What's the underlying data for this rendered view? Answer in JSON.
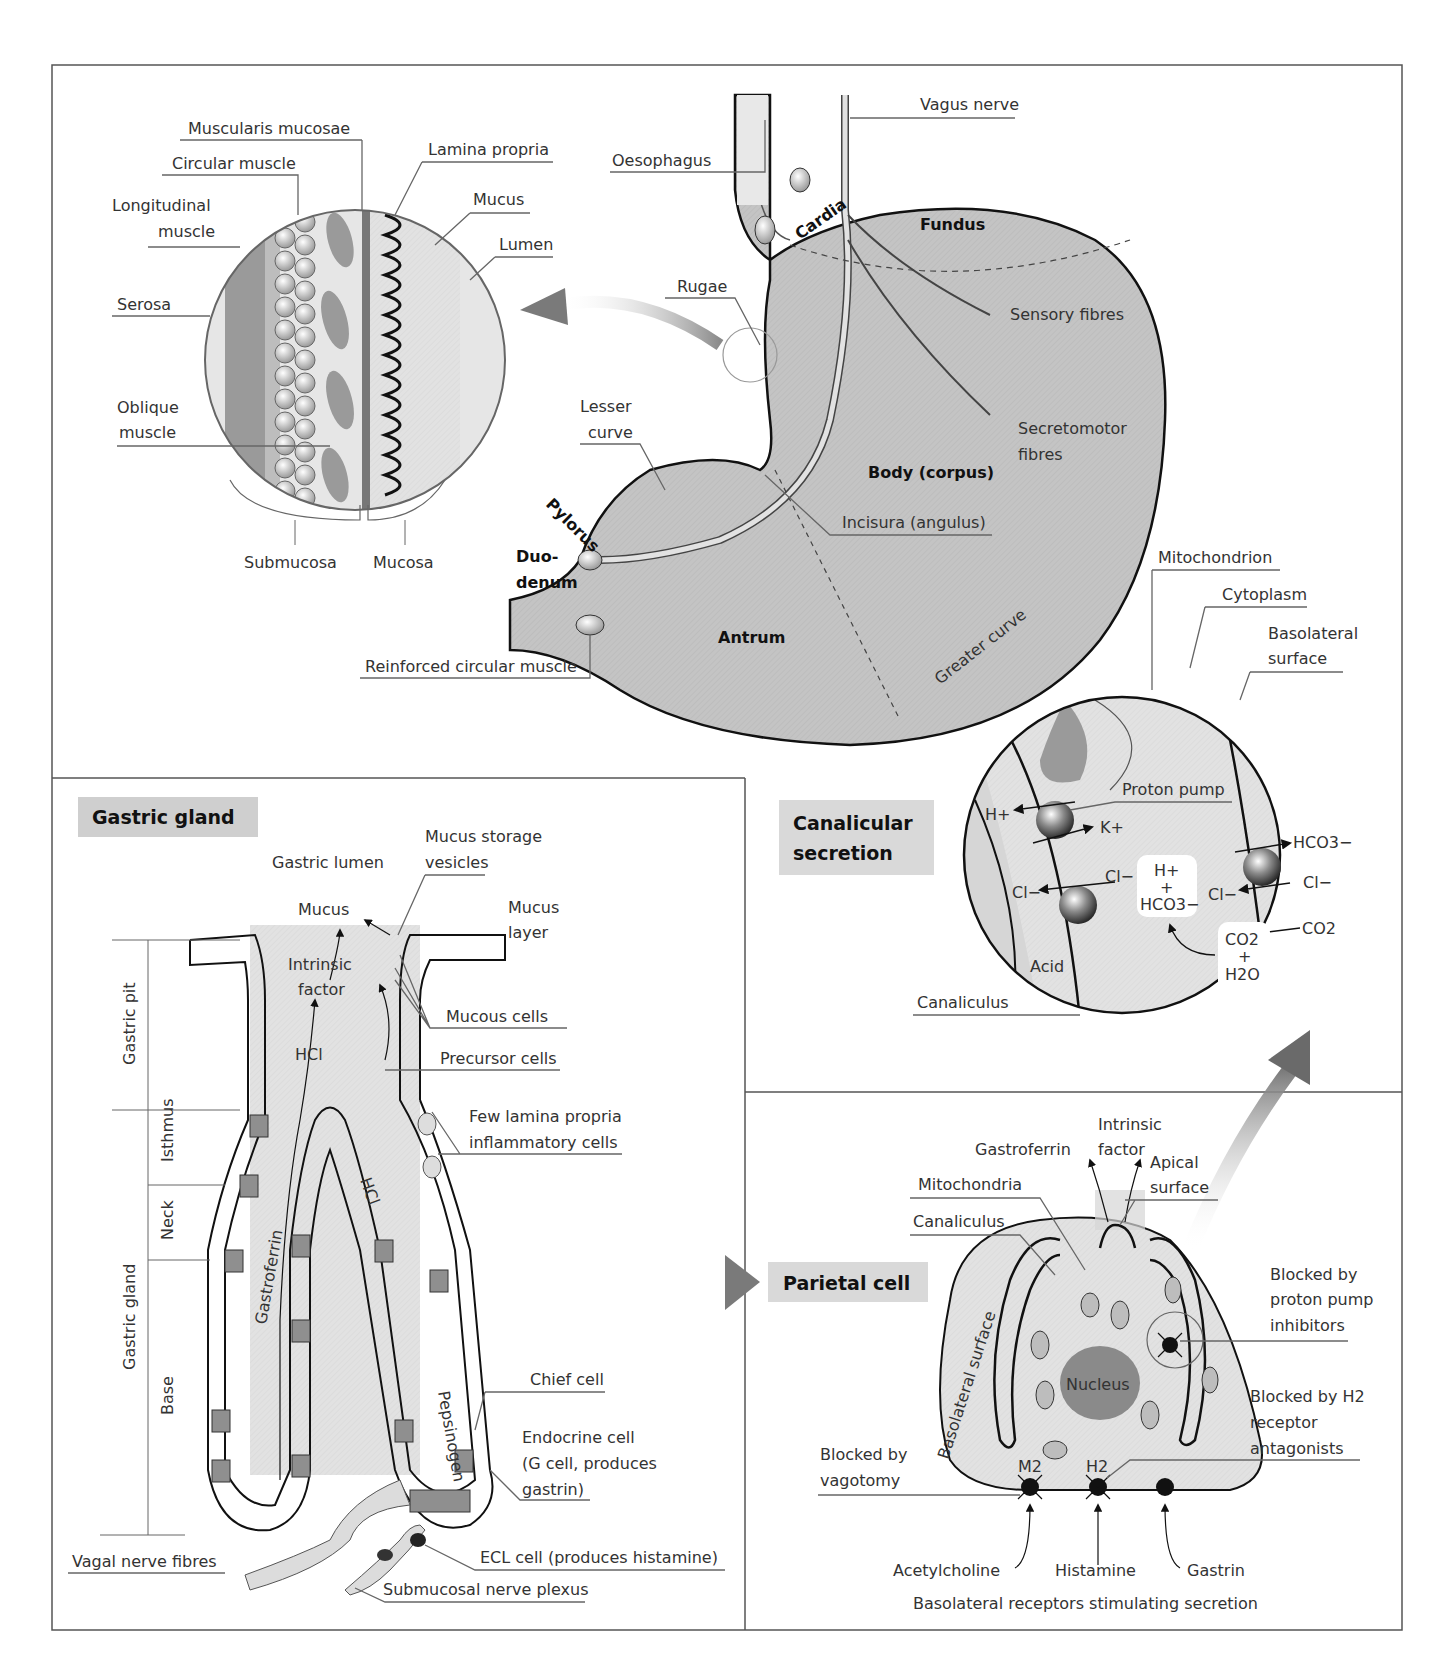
{
  "figure": {
    "panels": {
      "stomach": {
        "labels": {
          "vagus_nerve": "Vagus nerve",
          "oesophagus": "Oesophagus",
          "cardia": "Cardia",
          "fundus": "Fundus",
          "rugae": "Rugae",
          "sensory_fibres": "Sensory fibres",
          "secretomotor_1": "Secretomotor",
          "secretomotor_2": "fibres",
          "lesser_curve_1": "Lesser",
          "lesser_curve_2": "curve",
          "body": "Body (corpus)",
          "pylorus": "Pylorus",
          "incisura": "Incisura (angulus)",
          "duodenum_1": "Duo-",
          "duodenum_2": "denum",
          "antrum": "Antrum",
          "greater_curve": "Greater curve",
          "reinforced_muscle": "Reinforced circular muscle"
        }
      },
      "wall_section": {
        "labels": {
          "muscularis_mucosae": "Muscularis mucosae",
          "circular_muscle": "Circular muscle",
          "lamina_propria": "Lamina propria",
          "longitudinal_1": "Longitudinal",
          "longitudinal_2": "muscle",
          "mucus": "Mucus",
          "lumen": "Lumen",
          "serosa": "Serosa",
          "oblique_1": "Oblique",
          "oblique_2": "muscle",
          "submucosa": "Submucosa",
          "mucosa": "Mucosa"
        }
      },
      "gastric_gland": {
        "title": "Gastric gland",
        "labels": {
          "gastric_lumen": "Gastric lumen",
          "mucus_storage_1": "Mucus storage",
          "mucus_storage_2": "vesicles",
          "mucus": "Mucus",
          "mucus_layer_1": "Mucus",
          "mucus_layer_2": "layer",
          "intrinsic_1": "Intrinsic",
          "intrinsic_2": "factor",
          "mucous_cells": "Mucous cells",
          "hcl_1": "HCl",
          "hcl_2": "HCl",
          "precursor_cells": "Precursor cells",
          "inflammatory_1": "Few lamina propria",
          "inflammatory_2": "inflammatory cells",
          "gastroferrin": "Gastroferrin",
          "pepsinogen": "Pepsinogen",
          "chief_cell": "Chief cell",
          "endocrine_1": "Endocrine cell",
          "endocrine_2": "(G cell, produces",
          "endocrine_3": "gastrin)",
          "ecl_cell": "ECL cell (produces histamine)",
          "vagal_fibres": "Vagal nerve fibres",
          "submucosal_plexus": "Submucosal nerve plexus"
        },
        "zones": {
          "gastric_pit": "Gastric pit",
          "gastric_gland": "Gastric gland",
          "isthmus": "Isthmus",
          "neck": "Neck",
          "base": "Base"
        }
      },
      "canalicular": {
        "title_1": "Canalicular",
        "title_2": "secretion",
        "labels": {
          "mitochondrion": "Mitochondrion",
          "cytoplasm": "Cytoplasm",
          "basolateral_1": "Basolateral",
          "basolateral_2": "surface",
          "proton_pump": "Proton pump",
          "h_plus": "H+",
          "k_plus": "K+",
          "cl_out": "Cl−",
          "cl_in": "Cl−",
          "cl_mid": "Cl−",
          "cl_right": "Cl−",
          "hco3_out": "HCO3−",
          "box_h": "H+",
          "box_plus": "+",
          "box_hco3": "HCO3−",
          "co2_in": "CO2",
          "box2_co2": "CO2",
          "box2_plus": "+",
          "box2_h2o": "H2O",
          "acid": "Acid",
          "canaliculus": "Canaliculus"
        }
      },
      "parietal_cell": {
        "title": "Parietal cell",
        "labels": {
          "intrinsic_1": "Intrinsic",
          "intrinsic_2": "factor",
          "gastroferrin": "Gastroferrin",
          "apical_1": "Apical",
          "apical_2": "surface",
          "mitochondria": "Mitochondria",
          "canaliculus": "Canaliculus",
          "basolateral_surface": "Basolateral surface",
          "nucleus": "Nucleus",
          "ppi_1": "Blocked by",
          "ppi_2": "proton pump",
          "ppi_3": "inhibitors",
          "h2_1": "Blocked by H2",
          "h2_2": "receptor",
          "h2_3": "antagonists",
          "vag_1": "Blocked by",
          "vag_2": "vagotomy",
          "m2": "M2",
          "h2": "H2",
          "acetylcholine": "Acetylcholine",
          "histamine": "Histamine",
          "gastrin": "Gastrin",
          "caption": "Basolateral receptors stimulating secretion"
        }
      }
    }
  }
}
